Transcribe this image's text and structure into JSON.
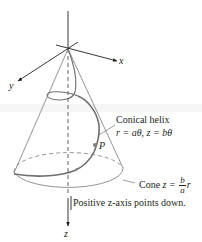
{
  "figure": {
    "type": "conical helix on inverted cone",
    "axes": {
      "x_label": "x",
      "y_label": "y",
      "z_label": "z"
    },
    "labels": {
      "helix_title": "Conical helix",
      "helix_eq_r": "r = aθ,",
      "helix_eq_z": "z = bθ",
      "point": "P",
      "cone_prefix": "Cone",
      "cone_eq_lhs": "z =",
      "cone_frac_num": "b",
      "cone_frac_den": "a",
      "cone_eq_var": "r",
      "note": "Positive z-axis points down."
    },
    "colors": {
      "ink": "#231f20",
      "cone_line": "#7a7a7a",
      "helix": "#6e6e6e",
      "point": "#808080"
    }
  }
}
